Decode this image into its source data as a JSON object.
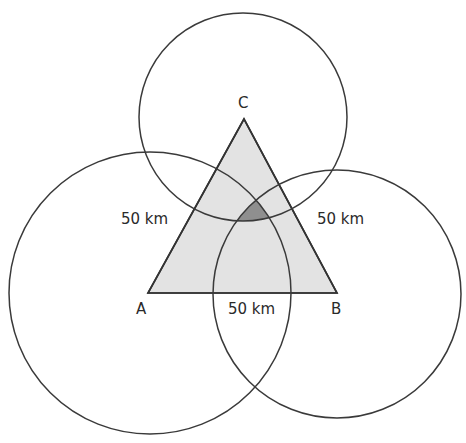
{
  "diagram": {
    "type": "trilateration",
    "points": {
      "A": {
        "label": "A",
        "x": 148,
        "y": 293
      },
      "B": {
        "label": "B",
        "x": 337,
        "y": 293
      },
      "C": {
        "label": "C",
        "x": 244,
        "y": 119
      }
    },
    "circles": [
      {
        "center": "A",
        "cx": 150,
        "cy": 293,
        "r": 141
      },
      {
        "center": "B",
        "cx": 337,
        "cy": 294,
        "r": 124
      },
      {
        "center": "C",
        "cx": 243,
        "cy": 117,
        "r": 104
      }
    ],
    "edge_labels": {
      "AC": "50 km",
      "BC": "50 km",
      "AB": "50 km"
    },
    "colors": {
      "stroke": "#333333",
      "triangle_fill": "#e3e3e3",
      "overlap_fill": "#8f8f8f",
      "background": "#ffffff"
    }
  }
}
